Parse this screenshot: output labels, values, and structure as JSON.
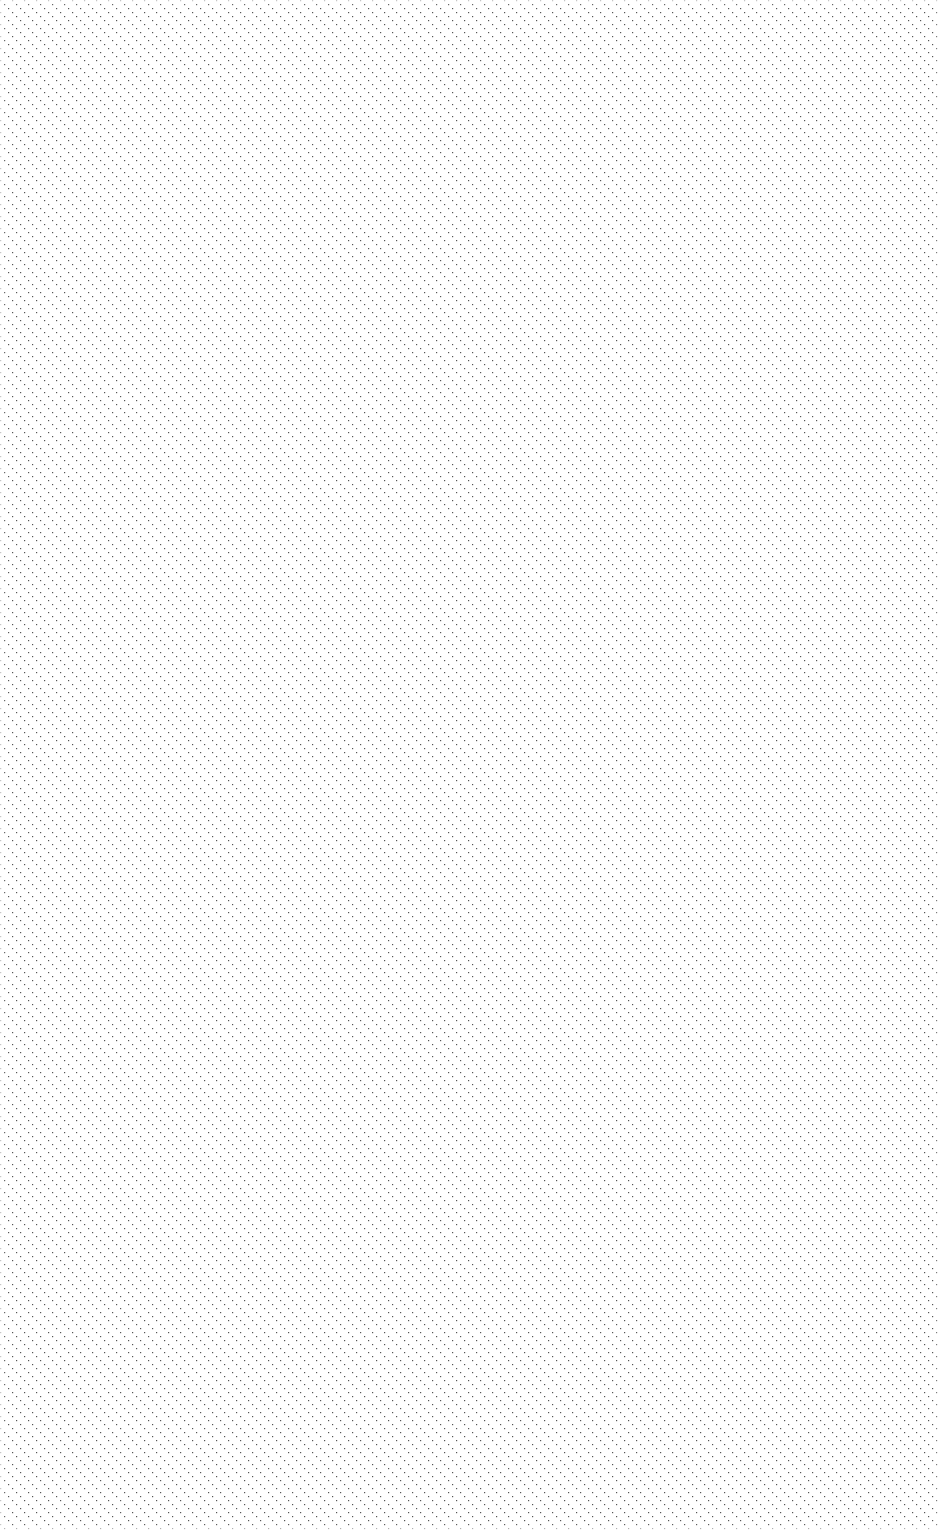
{
  "canvas": {
    "width": 940,
    "height": 1530,
    "background": "#ffffff"
  },
  "pattern": {
    "type": "diagonal-dotted-lines",
    "direction": "top-left to bottom-right",
    "angle_deg": 45,
    "line_spacing_px": 12,
    "dot_spacing_px": 4,
    "dot_color": "#555555"
  }
}
